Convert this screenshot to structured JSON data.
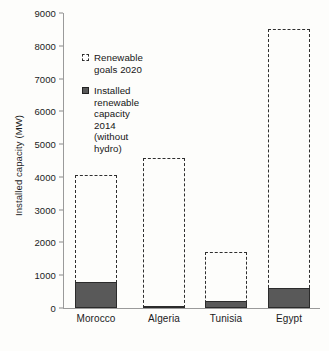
{
  "chart_data": {
    "type": "bar",
    "title": "",
    "xlabel": "",
    "ylabel": "Installed capacity (MW)",
    "categories": [
      "Morocco",
      "Algeria",
      "Tunisia",
      "Egypt"
    ],
    "ylim": [
      0,
      9000
    ],
    "ytick_labels": [
      "0",
      "1000",
      "2000",
      "3000",
      "4000",
      "5000",
      "6000",
      "7000",
      "8000",
      "9000"
    ],
    "ytick_values": [
      0,
      1000,
      2000,
      3000,
      4000,
      5000,
      6000,
      7000,
      8000,
      9000
    ],
    "grid": false,
    "legend_position": "upper-left-inside",
    "series": [
      {
        "name": "Renewable goals 2020",
        "style": "dashed-outline",
        "color": "#2e2e2e",
        "values": [
          4060,
          4590,
          1700,
          8500
        ]
      },
      {
        "name": "Installed renewable capacity\n2014 (without hydro)",
        "style": "filled",
        "color": "#595959",
        "values": [
          800,
          25,
          200,
          620
        ]
      }
    ]
  },
  "legend": {
    "entries": [
      {
        "label": "Renewable goals 2020"
      },
      {
        "label": "Installed renewable capacity\n2014 (without hydro)"
      }
    ]
  },
  "axis": {
    "y_title": "Installed capacity (MW)"
  }
}
